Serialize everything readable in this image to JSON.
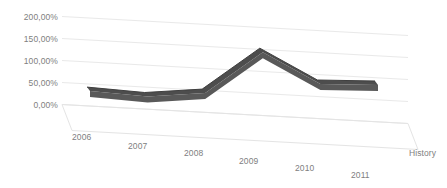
{
  "chart_data": {
    "type": "line",
    "title": "",
    "subtitle": "",
    "xlabel": "",
    "ylabel": "",
    "categories": [
      "2006",
      "2007",
      "2008",
      "2009",
      "2010",
      "2011"
    ],
    "series": [
      {
        "name": "History",
        "values": [
          35,
          30,
          45,
          145,
          80,
          85
        ],
        "color": "#595959"
      }
    ],
    "ylim": [
      0,
      200
    ],
    "y_ticks": [
      0,
      50,
      100,
      150,
      200
    ],
    "y_tick_labels": [
      "0,00%",
      "50,00%",
      "100,00%",
      "150,00%",
      "200,00%"
    ],
    "x_tick_labels": [
      "2006",
      "2007",
      "2008",
      "2009",
      "2010",
      "2011"
    ],
    "legend": {
      "position": "right",
      "entries": [
        "History"
      ]
    },
    "grid": true,
    "grid_color": "#e8e8e8",
    "style": "3d-line",
    "background": "#ffffff",
    "tick_label_color": "#808080"
  },
  "legend": {
    "series_label": "History"
  }
}
